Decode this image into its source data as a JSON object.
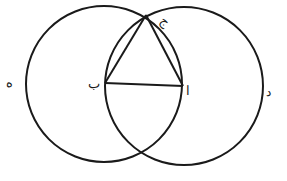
{
  "diagram": {
    "stroke_color": "#1a1a1a",
    "background": "#ffffff",
    "points": {
      "alif": {
        "label": "ا",
        "x": 183,
        "y": 86
      },
      "ba": {
        "label": "ب",
        "x": 105,
        "y": 83
      },
      "jim": {
        "label": "ج",
        "x": 146,
        "y": 15
      },
      "dal": {
        "label": "د",
        "x": 269,
        "y": 92
      },
      "heh": {
        "label": "ه",
        "x": 11,
        "y": 82
      }
    },
    "circles": [
      {
        "name": "circle-centered-ba",
        "cx": 104,
        "cy": 84,
        "r": 78
      },
      {
        "name": "circle-centered-alif",
        "cx": 184,
        "cy": 86,
        "r": 79
      }
    ],
    "segments": [
      {
        "name": "segment-ba-alif",
        "from": "ba",
        "to": "alif"
      },
      {
        "name": "segment-ba-jim",
        "from": "ba",
        "to": "jim"
      },
      {
        "name": "segment-alif-jim",
        "from": "alif",
        "to": "jim"
      }
    ]
  }
}
